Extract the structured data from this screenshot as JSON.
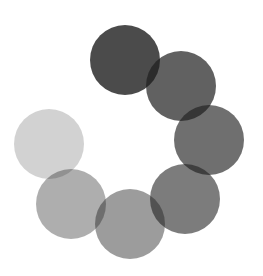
{
  "spinner": {
    "type": "loading-spinner",
    "base_color": "#1e1e1e",
    "radius": 35,
    "dots": [
      {
        "cx": 125,
        "cy": 60,
        "opacity": 0.8
      },
      {
        "cx": 181,
        "cy": 86,
        "opacity": 0.7
      },
      {
        "cx": 209,
        "cy": 140,
        "opacity": 0.64
      },
      {
        "cx": 185,
        "cy": 199,
        "opacity": 0.58
      },
      {
        "cx": 130,
        "cy": 224,
        "opacity": 0.44
      },
      {
        "cx": 71,
        "cy": 204,
        "opacity": 0.36
      },
      {
        "cx": 49,
        "cy": 144,
        "opacity": 0.2
      }
    ]
  }
}
